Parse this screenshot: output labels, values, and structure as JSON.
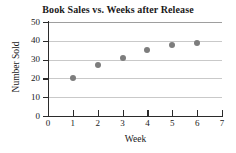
{
  "chart_data": {
    "type": "scatter",
    "title": "Book Sales vs. Weeks after Release",
    "xlabel": "Week",
    "ylabel": "Number Sold",
    "x": [
      1,
      2,
      3,
      4,
      5,
      6
    ],
    "values": [
      20,
      27,
      31,
      35,
      38,
      39
    ],
    "series": [
      {
        "name": "Number Sold",
        "x": [
          1,
          2,
          3,
          4,
          5,
          6
        ],
        "values": [
          20,
          27,
          31,
          35,
          38,
          39
        ]
      }
    ],
    "points": [
      {
        "x": 1,
        "y": 20
      },
      {
        "x": 2,
        "y": 27
      },
      {
        "x": 3,
        "y": 31
      },
      {
        "x": 4,
        "y": 35
      },
      {
        "x": 5,
        "y": 38
      },
      {
        "x": 6,
        "y": 39
      }
    ],
    "xlim": [
      0,
      7
    ],
    "ylim": [
      0,
      50
    ],
    "xticks": [
      "0",
      "1",
      "2",
      "3",
      "4",
      "5",
      "6",
      "7"
    ],
    "yticks": [
      "0",
      "10",
      "20",
      "30",
      "40",
      "50"
    ],
    "xtick_values": [
      0,
      1,
      2,
      3,
      4,
      5,
      6,
      7
    ],
    "ytick_values": [
      0,
      10,
      20,
      30,
      40,
      50
    ],
    "grid": "horizontal",
    "legend": null,
    "marker_color": "#7d7d7d",
    "gridline_color": "#c9c9c9",
    "axis_color": "#2b2b2b",
    "background_color": "#ffffff"
  }
}
